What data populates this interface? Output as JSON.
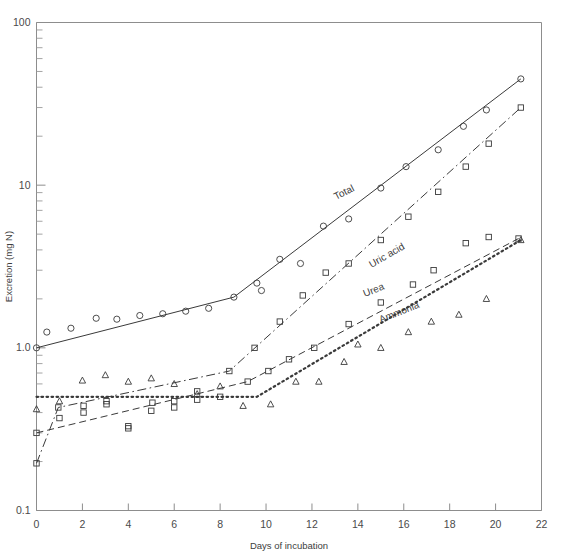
{
  "figure": {
    "background": "#ffffff",
    "ink_color": "#3a3a3a",
    "axis_color": "#8d8d8d"
  },
  "chart_data": {
    "type": "line",
    "title": "",
    "subtitle": "",
    "xlabel": "Days of incubation",
    "ylabel": "Excretion (mg N)",
    "xlim": [
      0,
      22
    ],
    "ylim": [
      0.1,
      100
    ],
    "yscale": "log",
    "xscale": "linear",
    "grid": false,
    "legend": "inline-labels",
    "x_ticks": [
      0,
      2,
      4,
      6,
      8,
      10,
      12,
      14,
      16,
      18,
      20,
      22
    ],
    "x_tick_labels": [
      "0",
      "2",
      "4",
      "6",
      "8",
      "10",
      "12",
      "14",
      "16",
      "18",
      "20",
      "22"
    ],
    "y_ticks": [
      0.1,
      1.0,
      10,
      100
    ],
    "y_tick_labels": [
      "0.1",
      "1.0",
      "10",
      "100"
    ],
    "y_minor_ticks": [
      0.2,
      0.3,
      0.4,
      0.5,
      0.6,
      0.7,
      0.8,
      0.9,
      2,
      3,
      4,
      5,
      6,
      7,
      8,
      9,
      20,
      30,
      40,
      50,
      60,
      70,
      80,
      90
    ],
    "series": [
      {
        "name": "Total",
        "label": "Total",
        "label_x": 13.05,
        "label_y": 8.1,
        "label_rotation": -27,
        "marker": "open-circle",
        "linestyle": "solid",
        "fit_line": [
          {
            "x": 0,
            "y": 1.0
          },
          {
            "x": 8.6,
            "y": 2.05
          },
          {
            "x": 21.1,
            "y": 45.0
          }
        ],
        "points": [
          {
            "x": 0,
            "y": 1.0
          },
          {
            "x": 0.45,
            "y": 1.25
          },
          {
            "x": 1.5,
            "y": 1.32
          },
          {
            "x": 2.6,
            "y": 1.52
          },
          {
            "x": 3.5,
            "y": 1.5
          },
          {
            "x": 4.5,
            "y": 1.58
          },
          {
            "x": 5.5,
            "y": 1.62
          },
          {
            "x": 6.5,
            "y": 1.68
          },
          {
            "x": 7.5,
            "y": 1.75
          },
          {
            "x": 8.6,
            "y": 2.05
          },
          {
            "x": 9.6,
            "y": 2.5
          },
          {
            "x": 9.8,
            "y": 2.25
          },
          {
            "x": 10.6,
            "y": 3.5
          },
          {
            "x": 11.5,
            "y": 3.3
          },
          {
            "x": 12.5,
            "y": 5.6
          },
          {
            "x": 13.6,
            "y": 6.2
          },
          {
            "x": 15.0,
            "y": 9.6
          },
          {
            "x": 16.1,
            "y": 13.0
          },
          {
            "x": 17.5,
            "y": 16.5
          },
          {
            "x": 18.6,
            "y": 23.0
          },
          {
            "x": 19.6,
            "y": 29.0
          },
          {
            "x": 21.1,
            "y": 45.0
          }
        ]
      },
      {
        "name": "Uric acid",
        "label": "Uric acid",
        "label_x": 14.6,
        "label_y": 3.1,
        "label_rotation": -30,
        "marker": "open-square",
        "linestyle": "dash-dot",
        "fit_line": [
          {
            "x": 0,
            "y": 0.195
          },
          {
            "x": 0.95,
            "y": 0.43
          },
          {
            "x": 8.4,
            "y": 0.72
          },
          {
            "x": 21.1,
            "y": 30.0
          }
        ],
        "points": [
          {
            "x": 0,
            "y": 0.195
          },
          {
            "x": 0.95,
            "y": 0.43
          },
          {
            "x": 2.05,
            "y": 0.44
          },
          {
            "x": 3.05,
            "y": 0.47
          },
          {
            "x": 4.0,
            "y": 0.33
          },
          {
            "x": 5.05,
            "y": 0.46
          },
          {
            "x": 6.0,
            "y": 0.47
          },
          {
            "x": 7.0,
            "y": 0.54
          },
          {
            "x": 8.4,
            "y": 0.72
          },
          {
            "x": 9.5,
            "y": 1.0
          },
          {
            "x": 10.6,
            "y": 1.45
          },
          {
            "x": 11.6,
            "y": 2.1
          },
          {
            "x": 12.6,
            "y": 2.9
          },
          {
            "x": 13.6,
            "y": 3.3
          },
          {
            "x": 15.0,
            "y": 4.6
          },
          {
            "x": 16.2,
            "y": 6.4
          },
          {
            "x": 17.5,
            "y": 9.1
          },
          {
            "x": 18.7,
            "y": 13.0
          },
          {
            "x": 19.7,
            "y": 18.0
          },
          {
            "x": 21.1,
            "y": 30.0
          }
        ]
      },
      {
        "name": "Urea",
        "label": "Urea",
        "label_x": 14.3,
        "label_y": 2.05,
        "label_rotation": -22,
        "marker": "open-square",
        "linestyle": "dashed",
        "fit_line": [
          {
            "x": 0,
            "y": 0.3
          },
          {
            "x": 9.2,
            "y": 0.62
          },
          {
            "x": 21.0,
            "y": 4.7
          }
        ],
        "points": [
          {
            "x": 0,
            "y": 0.3
          },
          {
            "x": 1.0,
            "y": 0.37
          },
          {
            "x": 2.05,
            "y": 0.4
          },
          {
            "x": 3.05,
            "y": 0.45
          },
          {
            "x": 4.0,
            "y": 0.32
          },
          {
            "x": 5.0,
            "y": 0.41
          },
          {
            "x": 6.0,
            "y": 0.43
          },
          {
            "x": 7.0,
            "y": 0.48
          },
          {
            "x": 8.0,
            "y": 0.5
          },
          {
            "x": 9.2,
            "y": 0.62
          },
          {
            "x": 10.1,
            "y": 0.72
          },
          {
            "x": 11.0,
            "y": 0.85
          },
          {
            "x": 12.1,
            "y": 1.0
          },
          {
            "x": 13.6,
            "y": 1.4
          },
          {
            "x": 15.0,
            "y": 1.9
          },
          {
            "x": 16.4,
            "y": 2.45
          },
          {
            "x": 17.3,
            "y": 3.0
          },
          {
            "x": 18.7,
            "y": 4.4
          },
          {
            "x": 19.7,
            "y": 4.8
          },
          {
            "x": 21.0,
            "y": 4.7
          }
        ]
      },
      {
        "name": "Ammonia",
        "label": "Ammonia",
        "label_x": 15.0,
        "label_y": 1.42,
        "label_rotation": -22,
        "marker": "open-triangle",
        "linestyle": "dotted",
        "fit_line": [
          {
            "x": 0,
            "y": 0.5
          },
          {
            "x": 9.6,
            "y": 0.5
          },
          {
            "x": 21.1,
            "y": 4.6
          }
        ],
        "points": [
          {
            "x": 0,
            "y": 0.42
          },
          {
            "x": 1.0,
            "y": 0.47
          },
          {
            "x": 2.0,
            "y": 0.63
          },
          {
            "x": 3.0,
            "y": 0.68
          },
          {
            "x": 4.0,
            "y": 0.62
          },
          {
            "x": 5.0,
            "y": 0.65
          },
          {
            "x": 6.0,
            "y": 0.6
          },
          {
            "x": 7.0,
            "y": 0.52
          },
          {
            "x": 8.0,
            "y": 0.58
          },
          {
            "x": 9.0,
            "y": 0.44
          },
          {
            "x": 10.2,
            "y": 0.45
          },
          {
            "x": 11.3,
            "y": 0.62
          },
          {
            "x": 12.3,
            "y": 0.62
          },
          {
            "x": 13.4,
            "y": 0.82
          },
          {
            "x": 14.0,
            "y": 1.05
          },
          {
            "x": 15.0,
            "y": 1.0
          },
          {
            "x": 16.2,
            "y": 1.25
          },
          {
            "x": 17.2,
            "y": 1.45
          },
          {
            "x": 18.4,
            "y": 1.6
          },
          {
            "x": 19.6,
            "y": 2.0
          },
          {
            "x": 21.1,
            "y": 4.6
          }
        ]
      }
    ]
  }
}
